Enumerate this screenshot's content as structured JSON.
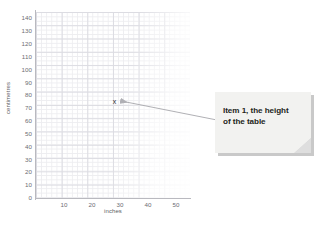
{
  "chart_data": {
    "type": "scatter",
    "title": "",
    "xlabel": "inches",
    "ylabel": "centimetres",
    "xlim": [
      0,
      55
    ],
    "ylim": [
      0,
      145
    ],
    "grid": true,
    "legend": null,
    "x_ticks": [
      "10",
      "20",
      "30",
      "40",
      "50"
    ],
    "x_tick_values": [
      10,
      20,
      30,
      40,
      50
    ],
    "y_ticks": [
      "0",
      "10",
      "20",
      "30",
      "40",
      "50",
      "60",
      "70",
      "80",
      "90",
      "100",
      "110",
      "120",
      "130",
      "140"
    ],
    "y_tick_values": [
      0,
      10,
      20,
      30,
      40,
      50,
      60,
      70,
      80,
      90,
      100,
      110,
      120,
      130,
      140
    ],
    "points": [
      {
        "label": "Item 1, the height of the table",
        "marker": "x",
        "x": 28,
        "y": 75
      }
    ],
    "annotations": [
      {
        "text": "Item 1, the height of the table",
        "points_to": {
          "x": 28,
          "y": 75
        }
      }
    ]
  },
  "axes": {
    "y_title": "centimetres",
    "x_title": "inches"
  },
  "marker": {
    "glyph": "x"
  },
  "callout": {
    "line1": "Item 1, the height",
    "line2": "of the table",
    "text": "Item 1, the height of the table"
  },
  "colors": {
    "background": "#ffffff",
    "grid_minor": "#ededf0",
    "grid_major": "#dcdce2",
    "axis": "#b9b9bf",
    "tick_text": "#6d6d73",
    "callout_fill": "#f2f2f0",
    "callout_text": "#231f20",
    "callout_shadow": "#c9c9c9",
    "leader_line": "#9a9a9f"
  }
}
